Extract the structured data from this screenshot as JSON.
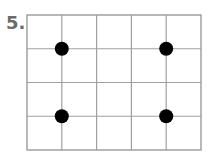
{
  "problem_number": "5.",
  "grid": {
    "columns": 5,
    "rows": 4,
    "x0": 27,
    "y0": 15,
    "x1": 201,
    "y1": 150,
    "line_color": "#a0a0a0",
    "border_color": "#9a9a9a"
  },
  "dots": [
    {
      "col_line": 1,
      "row_line": 1
    },
    {
      "col_line": 4,
      "row_line": 1
    },
    {
      "col_line": 1,
      "row_line": 3
    },
    {
      "col_line": 4,
      "row_line": 3
    }
  ],
  "dot_color": "#000000",
  "dot_radius": 7
}
